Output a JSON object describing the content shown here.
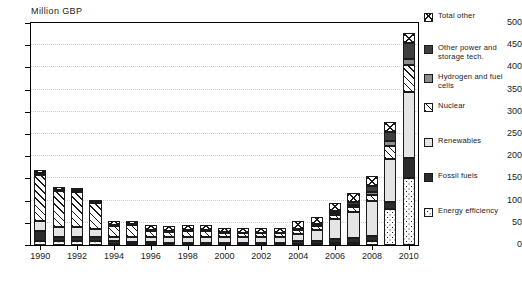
{
  "chart_data": {
    "type": "bar",
    "title": "",
    "subtitle": "",
    "ylabel": "Million GBP",
    "xlabel": "",
    "ylim": [
      0,
      500
    ],
    "ytick_step": 50,
    "yticks": [
      0,
      50,
      100,
      150,
      200,
      250,
      300,
      350,
      400,
      450,
      500
    ],
    "grid": true,
    "stacked": true,
    "legend_position": "right",
    "categories": [
      "1990",
      "1991",
      "1992",
      "1993",
      "1994",
      "1995",
      "1996",
      "1997",
      "1998",
      "1999",
      "2000",
      "2001",
      "2002",
      "2003",
      "2004",
      "2005",
      "2006",
      "2007",
      "2008",
      "2009",
      "2010"
    ],
    "xtick_labels": [
      "1990",
      "1992",
      "1994",
      "1996",
      "1998",
      "2000",
      "2002",
      "2004",
      "2006",
      "2008",
      "2010"
    ],
    "series": [
      {
        "name": "Energy efficiency",
        "pattern": "dotted",
        "values": [
          9,
          8,
          8,
          8,
          3,
          3,
          3,
          2,
          2,
          2,
          2,
          2,
          2,
          2,
          3,
          3,
          4,
          5,
          8,
          80,
          150
        ]
      },
      {
        "name": "Fossil fuels",
        "pattern": "dark-solid",
        "values": [
          22,
          11,
          11,
          9,
          5,
          4,
          4,
          3,
          3,
          3,
          3,
          3,
          3,
          3,
          5,
          6,
          9,
          10,
          13,
          16,
          45
        ]
      },
      {
        "name": "Renewables",
        "pattern": "light-solid",
        "values": [
          22,
          22,
          22,
          20,
          11,
          12,
          12,
          12,
          13,
          13,
          13,
          12,
          12,
          12,
          17,
          25,
          45,
          60,
          78,
          98,
          150
        ]
      },
      {
        "name": "Nuclear",
        "pattern": "diagonal-hatch",
        "values": [
          104,
          80,
          78,
          57,
          24,
          26,
          13,
          13,
          13,
          13,
          9,
          9,
          9,
          9,
          9,
          9,
          10,
          11,
          13,
          30,
          60
        ]
      },
      {
        "name": "Hydrogen and fuel cells",
        "pattern": "mid-gray",
        "values": [
          0,
          0,
          0,
          0,
          0,
          0,
          0,
          0,
          0,
          0,
          0,
          0,
          0,
          0,
          0,
          2,
          3,
          4,
          8,
          11,
          14
        ]
      },
      {
        "name": "Other power and storage tech.",
        "pattern": "dark-gray",
        "values": [
          5,
          4,
          4,
          3,
          2,
          2,
          2,
          2,
          2,
          2,
          2,
          2,
          2,
          2,
          3,
          3,
          5,
          8,
          12,
          20,
          35
        ]
      },
      {
        "name": "Total other",
        "pattern": "cross-hatch",
        "values": [
          7,
          6,
          6,
          5,
          9,
          8,
          11,
          10,
          11,
          11,
          10,
          10,
          10,
          10,
          17,
          16,
          18,
          20,
          23,
          23,
          24
        ]
      }
    ],
    "totals": [
      169,
      131,
      129,
      102,
      54,
      55,
      45,
      42,
      44,
      44,
      39,
      38,
      38,
      38,
      54,
      64,
      94,
      118,
      155,
      278,
      478
    ]
  },
  "legend": {
    "items": [
      {
        "label": "Total other",
        "swatch": "cross-hatch-swatch"
      },
      {
        "label": "Other power and storage tech.",
        "swatch": "dark-gray-swatch"
      },
      {
        "label": "Hydrogen and fuel cells",
        "swatch": "mid-gray-swatch"
      },
      {
        "label": "Nuclear",
        "swatch": "diagonal-hatch-swatch"
      },
      {
        "label": "Renewables",
        "swatch": "light-solid-swatch"
      },
      {
        "label": "Fossil fuels",
        "swatch": "dark-solid-swatch"
      },
      {
        "label": "Energy efficiency",
        "swatch": "dotted-swatch"
      }
    ]
  }
}
